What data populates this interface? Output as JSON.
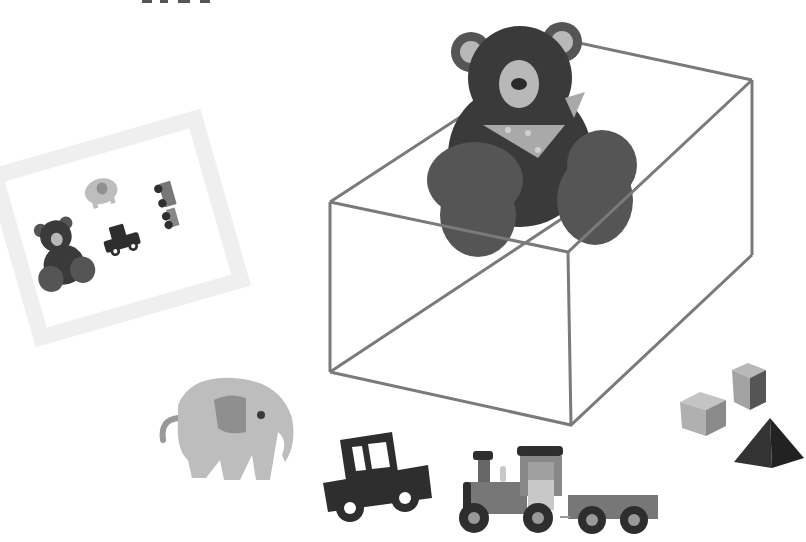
{
  "scene": {
    "description": "Grayscale illustration of toys: a teddy bear seated on top of a wireframe box, a tilted photo showing the toys, an elephant, a car, a train, and building blocks",
    "colors": {
      "background": "#ffffff",
      "box_line": "#7a7a7a",
      "bear_dark": "#3a3a3a",
      "bear_limb": "#555555",
      "bear_muzzle": "#b8b8b8",
      "scarf": "#a9a9a9",
      "elephant": "#bdbdbd",
      "elephant_ear": "#8f8f8f",
      "car": "#2e2e2e",
      "train_body": "#777777",
      "train_light": "#c8c8c8",
      "wheel": "#2e2e2e",
      "block_light": "#b0b0b0",
      "block_dark": "#333333",
      "photo_frame": "#f0f0f0"
    }
  },
  "objects": [
    {
      "name": "teddy-bear",
      "location": "on top of box"
    },
    {
      "name": "wireframe-box",
      "location": "center right"
    },
    {
      "name": "toy-photo",
      "location": "left, tilted",
      "contents": [
        "teddy bear",
        "elephant",
        "car",
        "train"
      ]
    },
    {
      "name": "elephant",
      "location": "bottom left"
    },
    {
      "name": "car",
      "location": "bottom center"
    },
    {
      "name": "train",
      "location": "bottom center right"
    },
    {
      "name": "blocks",
      "location": "right",
      "items": [
        "cube",
        "tall block",
        "triangular prism"
      ]
    }
  ]
}
